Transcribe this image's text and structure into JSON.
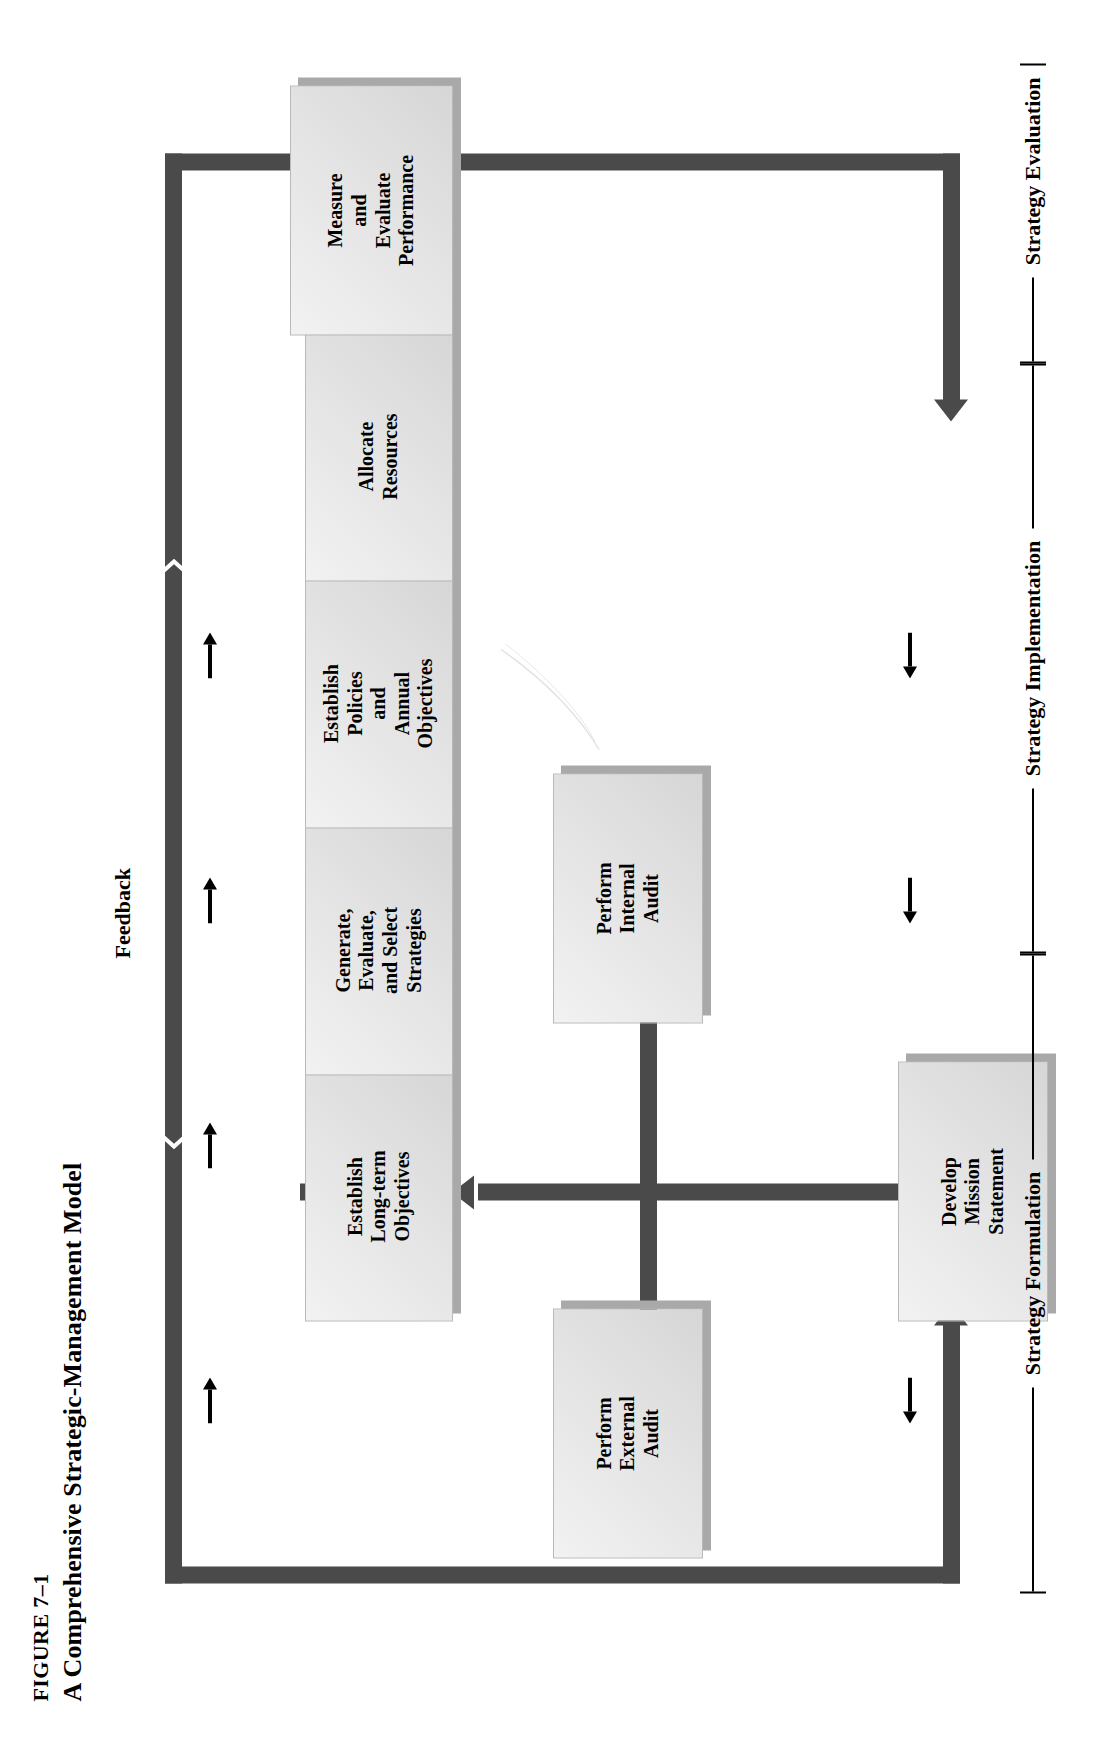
{
  "figure": {
    "number": "FIGURE 7–1",
    "title": "A Comprehensive Strategic-Management Model"
  },
  "feedback_label": "Feedback",
  "nodes": [
    {
      "id": "develop-mission-statement",
      "lines": [
        "Develop",
        "Mission",
        "Statement"
      ]
    },
    {
      "id": "perform-external-audit",
      "lines": [
        "Perform",
        "External",
        "Audit"
      ]
    },
    {
      "id": "perform-internal-audit",
      "lines": [
        "Perform",
        "Internal",
        "Audit"
      ]
    },
    {
      "id": "establish-long-term-objectives",
      "lines": [
        "Establish",
        "Long-term",
        "Objectives"
      ]
    },
    {
      "id": "generate-evaluate-select-strategies",
      "lines": [
        "Generate,",
        "Evaluate,",
        "and Select",
        "Strategies"
      ]
    },
    {
      "id": "establish-policies-annual-objectives",
      "lines": [
        "Establish",
        "Policies",
        "and",
        "Annual",
        "Objectives"
      ]
    },
    {
      "id": "allocate-resources",
      "lines": [
        "Allocate",
        "Resources"
      ]
    },
    {
      "id": "measure-evaluate-performance",
      "lines": [
        "Measure",
        "and",
        "Evaluate",
        "Performance"
      ]
    }
  ],
  "phases": [
    {
      "id": "strategy-formulation",
      "label": "Strategy Formulation"
    },
    {
      "id": "strategy-implementation",
      "label": "Strategy Implementation"
    },
    {
      "id": "strategy-evaluation",
      "label": "Strategy Evaluation"
    }
  ],
  "colors": {
    "connector": "#4a4a4a",
    "box_fill": "#e9e9e9",
    "box_shadow": "#a9a9a9",
    "text": "#000000",
    "background": "#ffffff"
  },
  "flow_sequence": [
    "Develop Mission Statement",
    "Perform External Audit / Perform Internal Audit",
    "Establish Long-term Objectives",
    "Generate, Evaluate, and Select Strategies",
    "Establish Policies and Annual Objectives",
    "Allocate Resources",
    "Measure and Evaluate Performance"
  ]
}
